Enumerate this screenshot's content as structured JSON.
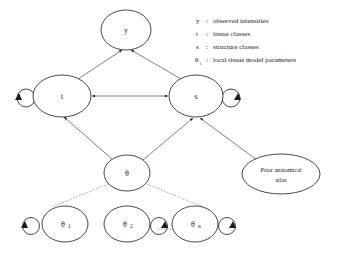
{
  "diagram": {
    "type": "graphical-model",
    "title": "",
    "background_color": "#ffffff",
    "stroke_color": "#1a1a1a",
    "edge_color": "#4a4a4a",
    "nodes": [
      {
        "id": "y",
        "label": "y",
        "subscript": "",
        "cx": 126,
        "cy": 30,
        "rx": 25,
        "ry": 20,
        "self_loop": "none"
      },
      {
        "id": "t",
        "label": "t",
        "subscript": "",
        "cx": 62,
        "cy": 96,
        "rx": 29,
        "ry": 21,
        "self_loop": "left"
      },
      {
        "id": "s",
        "label": "s",
        "subscript": "",
        "cx": 196,
        "cy": 96,
        "rx": 27,
        "ry": 21,
        "self_loop": "right"
      },
      {
        "id": "theta",
        "label": "θ",
        "subscript": "",
        "cx": 127,
        "cy": 173,
        "rx": 23,
        "ry": 18,
        "self_loop": "none"
      },
      {
        "id": "theta1",
        "label": "θ",
        "subscript": "1",
        "cx": 65,
        "cy": 224,
        "rx": 23,
        "ry": 18,
        "self_loop": "left"
      },
      {
        "id": "theta2",
        "label": "θ",
        "subscript": "2",
        "cx": 127,
        "cy": 224,
        "rx": 23,
        "ry": 18,
        "self_loop": "right"
      },
      {
        "id": "thetan",
        "label": "θ",
        "subscript": "n",
        "cx": 195,
        "cy": 224,
        "rx": 23,
        "ry": 18,
        "self_loop": "right"
      }
    ],
    "atlas_node": {
      "id": "atlas",
      "cx": 281,
      "cy": 174,
      "rx": 39,
      "ry": 20,
      "line1": "Prior anatomical",
      "line2": "atlas"
    },
    "edges": [
      {
        "from": "t",
        "to": "y",
        "style": "solid",
        "arrow": "end"
      },
      {
        "from": "s",
        "to": "y",
        "style": "solid",
        "arrow": "end"
      },
      {
        "from": "t",
        "to": "s",
        "style": "solid",
        "arrow": "both"
      },
      {
        "from": "theta",
        "to": "t",
        "style": "solid",
        "arrow": "end"
      },
      {
        "from": "theta",
        "to": "s",
        "style": "solid",
        "arrow": "end"
      },
      {
        "from": "atlas",
        "to": "s",
        "style": "solid",
        "arrow": "end"
      },
      {
        "from": "theta",
        "to": "theta1",
        "style": "dotted",
        "arrow": "none"
      },
      {
        "from": "theta",
        "to": "thetan",
        "style": "dotted",
        "arrow": "none"
      },
      {
        "from": "theta2",
        "to": "thetan",
        "style": "dotted",
        "arrow": "none"
      }
    ]
  },
  "legend": {
    "items": [
      {
        "symbol": "y",
        "subscript": "",
        "separator": ":",
        "description": "observed intensities"
      },
      {
        "symbol": "t",
        "subscript": "",
        "separator": ":",
        "description": "tissue classes"
      },
      {
        "symbol": "s",
        "subscript": "",
        "separator": ":",
        "description": "structure classes"
      },
      {
        "symbol": "θ",
        "subscript": "i",
        "separator": ":",
        "description": "local tissue model parameters"
      }
    ]
  }
}
